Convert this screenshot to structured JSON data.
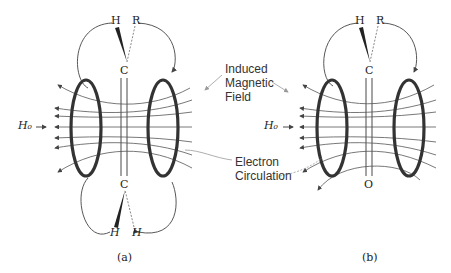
{
  "labels": {
    "induced": [
      "Induced",
      "Magnetic",
      "Field"
    ],
    "electron": [
      "Electron",
      "Circulation"
    ],
    "field": "H₀",
    "caption_a": "(a)",
    "caption_b": "(b)"
  },
  "panel_a": {
    "top_atoms": {
      "left": "H",
      "right": "R"
    },
    "top_carbon": "C",
    "bottom_carbon": "C",
    "bottom_atoms": {
      "left": "H",
      "right": "H"
    },
    "bond": "triple"
  },
  "panel_b": {
    "top_atoms": {
      "left": "H",
      "right": "R"
    },
    "top_carbon": "C",
    "bottom_atom": "O",
    "bond": "double"
  },
  "colors": {
    "ink": "#222222",
    "ring": "#333333",
    "pointer": "#888888"
  }
}
